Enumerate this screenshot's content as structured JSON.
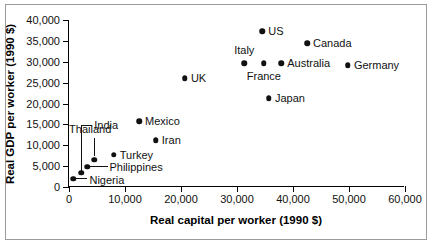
{
  "chart_data": {
    "type": "scatter",
    "title": "",
    "xlabel": "Real capital per worker (1990 $)",
    "ylabel": "Real GDP per worker (1990 $)",
    "xlim": [
      0,
      60000
    ],
    "ylim": [
      0,
      40000
    ],
    "xticks": [
      0,
      10000,
      20000,
      30000,
      40000,
      50000,
      60000
    ],
    "xticklabels": [
      "0",
      "10,000",
      "20,000",
      "30,000",
      "40,000",
      "50,000",
      "60,000"
    ],
    "yticks": [
      0,
      5000,
      10000,
      15000,
      20000,
      25000,
      30000,
      35000,
      40000
    ],
    "yticklabels": [
      "0",
      "5,000",
      "10,000",
      "15,000",
      "20,000",
      "25,000",
      "30,000",
      "35,000",
      "40,000"
    ],
    "grid": false,
    "legend": "none",
    "marker_color": "#111111",
    "points": [
      {
        "name": "US",
        "x": 34500,
        "y": 37300,
        "label_pos": "right"
      },
      {
        "name": "Canada",
        "x": 42500,
        "y": 34400,
        "label_pos": "right"
      },
      {
        "name": "Italy",
        "x": 31300,
        "y": 29600,
        "label_pos": "above"
      },
      {
        "name": "France",
        "x": 34800,
        "y": 29600,
        "label_pos": "below"
      },
      {
        "name": "Australia",
        "x": 37900,
        "y": 29600,
        "label_pos": "right"
      },
      {
        "name": "Germany",
        "x": 49800,
        "y": 29200,
        "label_pos": "right"
      },
      {
        "name": "Japan",
        "x": 35700,
        "y": 21300,
        "label_pos": "right"
      },
      {
        "name": "UK",
        "x": 20700,
        "y": 26100,
        "label_pos": "right"
      },
      {
        "name": "Mexico",
        "x": 12500,
        "y": 15800,
        "label_pos": "right"
      },
      {
        "name": "Iran",
        "x": 15500,
        "y": 11200,
        "label_pos": "right"
      },
      {
        "name": "Turkey",
        "x": 8000,
        "y": 7700,
        "label_pos": "right"
      },
      {
        "name": "Thailand",
        "x": 4500,
        "y": 6500,
        "label_pos": "leader-up"
      },
      {
        "name": "Philippines",
        "x": 3300,
        "y": 4900,
        "label_pos": "leader-right"
      },
      {
        "name": "India",
        "x": 2200,
        "y": 3400,
        "label_pos": "leader-bracket"
      },
      {
        "name": "Nigeria",
        "x": 800,
        "y": 2000,
        "label_pos": "leader-short"
      }
    ]
  }
}
